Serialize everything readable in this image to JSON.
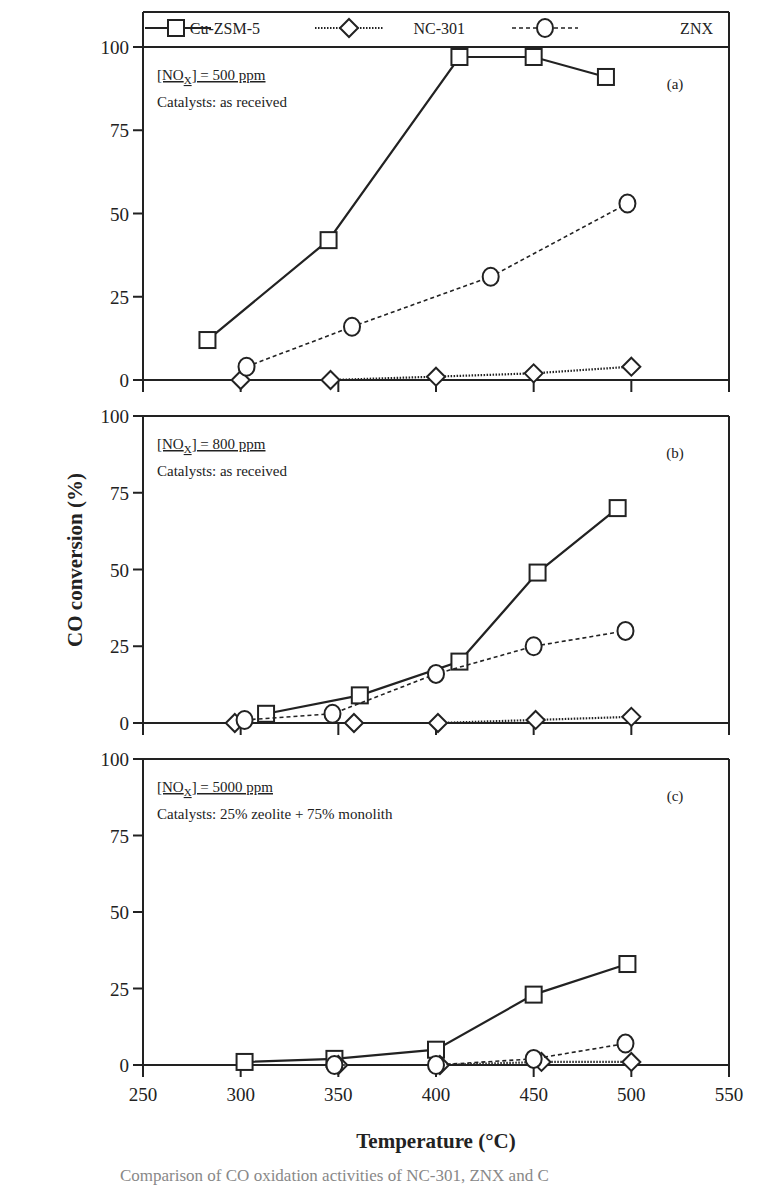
{
  "chart_data": {
    "type": "line",
    "xlabel": "Temperature (°C)",
    "ylabel": "CO conversion (%)",
    "xlim": [
      250,
      550
    ],
    "ylim": [
      0,
      100
    ],
    "x_ticks": [
      "250",
      "300",
      "350",
      "400",
      "450",
      "500",
      "550"
    ],
    "y_ticks": [
      "0",
      "25",
      "50",
      "75",
      "100"
    ],
    "grid": false,
    "legend": {
      "position": "top",
      "entries": [
        {
          "name": "Cu-ZSM-5",
          "marker": "square",
          "line": "solid"
        },
        {
          "name": "NC-301",
          "marker": "diamond",
          "line": "dotted"
        },
        {
          "name": "ZNX",
          "marker": "circle",
          "line": "dashed"
        }
      ]
    },
    "panels": [
      {
        "label": "(a)",
        "condition": "[NOx] = 500 ppm",
        "catalysts": "Catalysts: as received",
        "series": [
          {
            "name": "Cu-ZSM-5",
            "x": [
              283,
              345,
              412,
              450,
              487
            ],
            "values": [
              12,
              42,
              97,
              97,
              91
            ]
          },
          {
            "name": "NC-301",
            "x": [
              300,
              346,
              400,
              450,
              500
            ],
            "values": [
              0,
              0,
              1,
              2,
              4
            ]
          },
          {
            "name": "ZNX",
            "x": [
              303,
              357,
              428,
              498
            ],
            "values": [
              4,
              16,
              31,
              53
            ]
          }
        ]
      },
      {
        "label": "(b)",
        "condition": "[NOx] = 800 ppm",
        "catalysts": "Catalysts: as received",
        "series": [
          {
            "name": "Cu-ZSM-5",
            "x": [
              313,
              361,
              412,
              452,
              493
            ],
            "values": [
              3,
              9,
              20,
              49,
              70
            ]
          },
          {
            "name": "NC-301",
            "x": [
              297,
              358,
              401,
              451,
              500
            ],
            "values": [
              0,
              0,
              0,
              1,
              2
            ]
          },
          {
            "name": "ZNX",
            "x": [
              302,
              347,
              400,
              450,
              497
            ],
            "values": [
              1,
              3,
              16,
              25,
              30
            ]
          }
        ]
      },
      {
        "label": "(c)",
        "condition": "[NOx] = 5000 ppm",
        "catalysts": "Catalysts: 25% zeolite + 75% monolith",
        "series": [
          {
            "name": "Cu-ZSM-5",
            "x": [
              302,
              348,
              400,
              450,
              498
            ],
            "values": [
              1,
              2,
              5,
              23,
              33
            ]
          },
          {
            "name": "NC-301",
            "x": [
              350,
              402,
              454,
              500
            ],
            "values": [
              0,
              0,
              1,
              1
            ]
          },
          {
            "name": "ZNX",
            "x": [
              348,
              400,
              450,
              497
            ],
            "values": [
              0,
              0,
              2,
              7
            ]
          }
        ]
      }
    ]
  },
  "caption_fragment": "Comparison of CO oxidation activities of NC-301, ZNX and C"
}
